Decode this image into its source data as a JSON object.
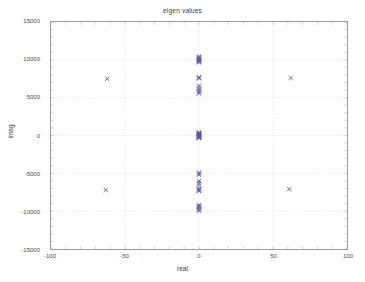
{
  "chart_data": {
    "type": "scatter",
    "title": "eigen values",
    "xlabel": "real",
    "ylabel": "imag",
    "xlim": [
      -100,
      100
    ],
    "ylim": [
      -15000,
      15000
    ],
    "xticks": [
      -100,
      -50,
      0,
      50,
      100
    ],
    "yticks": [
      15000,
      10000,
      5000,
      0,
      -5000,
      -10000,
      -15000
    ],
    "xtick_labels": [
      "-100",
      "-50",
      "0",
      "50",
      "100"
    ],
    "ytick_labels": [
      "15000",
      "10000",
      "5000",
      "0",
      "-5000",
      "-10000",
      "-15000"
    ],
    "grid": true,
    "grid_style": "dotted",
    "grid_color": "#cccccc",
    "legend": null,
    "marker": "x",
    "marker_color": "#5b5ba8",
    "axis_color": "#9a9a9a",
    "background": "#ffffff",
    "series": [
      {
        "name": "eigenvalues",
        "marker": "x",
        "color": "#5b5ba8",
        "points": [
          [
            0,
            10350
          ],
          [
            0,
            10200
          ],
          [
            0,
            10050
          ],
          [
            0,
            9950
          ],
          [
            0,
            9850
          ],
          [
            0,
            9750
          ],
          [
            0,
            9650
          ],
          [
            0,
            10450
          ],
          [
            0,
            10150
          ],
          [
            0,
            9900
          ],
          [
            0,
            7700
          ],
          [
            0,
            7600
          ],
          [
            0,
            7550
          ],
          [
            0,
            6600
          ],
          [
            0,
            6350
          ],
          [
            0,
            6100
          ],
          [
            0,
            5900
          ],
          [
            0,
            5700
          ],
          [
            0,
            5550
          ],
          [
            0,
            300
          ],
          [
            0,
            250
          ],
          [
            0,
            200
          ],
          [
            0,
            150
          ],
          [
            0,
            100
          ],
          [
            0,
            50
          ],
          [
            0,
            0
          ],
          [
            0,
            -50
          ],
          [
            0,
            -100
          ],
          [
            0,
            -150
          ],
          [
            0,
            -200
          ],
          [
            0,
            -250
          ],
          [
            0,
            350
          ],
          [
            0,
            400
          ],
          [
            0,
            -300
          ],
          [
            0,
            -350
          ],
          [
            0,
            -4900
          ],
          [
            0,
            -5050
          ],
          [
            0,
            -5200
          ],
          [
            0,
            -6000
          ],
          [
            0,
            -6300
          ],
          [
            0,
            -6600
          ],
          [
            0,
            -7000
          ],
          [
            0,
            -7150
          ],
          [
            0,
            -7250
          ],
          [
            0,
            -7350
          ],
          [
            0,
            -9200
          ],
          [
            0,
            -9350
          ],
          [
            0,
            -9500
          ],
          [
            0,
            -9650
          ],
          [
            0,
            -9800
          ],
          [
            0,
            -9950
          ],
          [
            -62,
            7500
          ],
          [
            62,
            7600
          ],
          [
            -63,
            -7200
          ],
          [
            61,
            -7100
          ]
        ]
      }
    ]
  },
  "figure": {
    "title": "eigen values",
    "xlabel": "real",
    "ylabel": "imag"
  }
}
